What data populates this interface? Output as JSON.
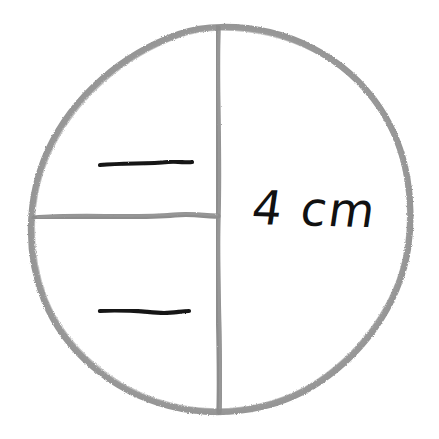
{
  "diagram": {
    "background_color": "#ffffff",
    "stroke_color_light": "#8d8d8d",
    "stroke_color_dark": "#1a1a1a",
    "circle": {
      "name": "circle-outline",
      "center_x": 221,
      "center_y": 217,
      "radius": 190
    },
    "vertical_diameter": {
      "name": "vertical-diameter-line",
      "x": 218,
      "y_start": 27,
      "y_end": 412
    },
    "horizontal_radius": {
      "name": "horizontal-radius-line",
      "y": 216,
      "x_start": 33,
      "x_end": 218
    },
    "tick_marks": [
      {
        "name": "tick-mark-upper",
        "x_start": 100,
        "x_end": 192,
        "y": 164
      },
      {
        "name": "tick-mark-lower",
        "x_start": 100,
        "x_end": 189,
        "y": 311
      }
    ],
    "labels": {
      "measure": "4 cm"
    }
  }
}
